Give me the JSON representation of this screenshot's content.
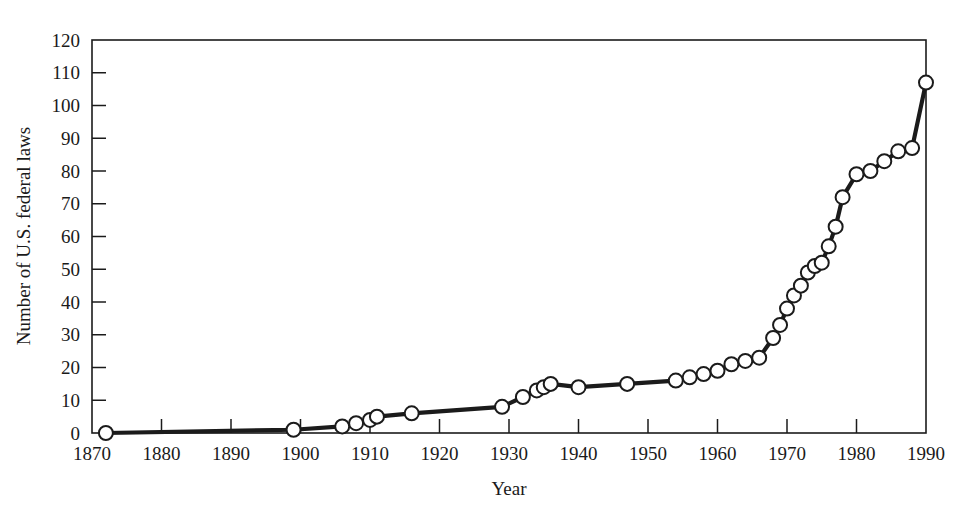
{
  "figure": {
    "background": "#ffffff",
    "ink_color": "#1b1b1b"
  },
  "chart_data": {
    "type": "line",
    "title": "",
    "xlabel": "Year",
    "ylabel": "Number of U.S. federal laws",
    "xlim": [
      1870,
      1990
    ],
    "ylim": [
      0,
      120
    ],
    "grid": false,
    "legend": null,
    "xticks": [
      1870,
      1880,
      1890,
      1900,
      1910,
      1920,
      1930,
      1940,
      1950,
      1960,
      1970,
      1980,
      1990
    ],
    "xticklabels": [
      "1870",
      "1880",
      "1890",
      "1900",
      "1910",
      "1920",
      "1930",
      "1940",
      "1950",
      "1960",
      "1970",
      "1980",
      "1990"
    ],
    "yticks": [
      0,
      10,
      20,
      30,
      40,
      50,
      60,
      70,
      80,
      90,
      100,
      110,
      120
    ],
    "yticklabels": [
      "0",
      "10",
      "20",
      "30",
      "40",
      "50",
      "60",
      "70",
      "80",
      "90",
      "100",
      "110",
      "120"
    ],
    "marker": "open-circle",
    "marker_size": 7,
    "line_width": 4.2,
    "series": [
      {
        "name": "Cumulative number of U.S. federal laws",
        "x": [
          1872,
          1899,
          1906,
          1908,
          1910,
          1911,
          1916,
          1929,
          1932,
          1934,
          1935,
          1936,
          1940,
          1947,
          1954,
          1956,
          1958,
          1960,
          1962,
          1964,
          1966,
          1968,
          1969,
          1970,
          1971,
          1972,
          1973,
          1974,
          1975,
          1976,
          1977,
          1978,
          1980,
          1982,
          1984,
          1986,
          1988,
          1990
        ],
        "y": [
          0,
          1,
          2,
          3,
          4,
          5,
          6,
          8,
          11,
          13,
          14,
          15,
          14,
          15,
          16,
          17,
          18,
          19,
          21,
          22,
          23,
          29,
          33,
          38,
          42,
          45,
          49,
          51,
          52,
          57,
          63,
          72,
          79,
          80,
          83,
          86,
          87,
          107
        ]
      }
    ]
  },
  "axis": {
    "x_title": "Year",
    "y_title": "Number of U.S. federal laws"
  }
}
